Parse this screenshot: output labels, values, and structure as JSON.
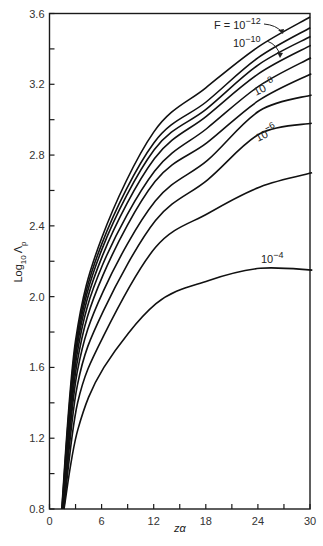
{
  "chart_data": {
    "type": "line",
    "title": "",
    "xlabel": "zα",
    "ylabel": "Log10 Λp",
    "xlim": [
      0,
      30
    ],
    "ylim": [
      0.8,
      3.6
    ],
    "grid": false,
    "legend_position": "inline labels on curves",
    "x_ticks": [
      0,
      6,
      12,
      18,
      24,
      30
    ],
    "x_minor_ticks": [
      3,
      9,
      15,
      21,
      27
    ],
    "y_ticks": [
      0.8,
      1.2,
      1.6,
      2.0,
      2.4,
      2.8,
      3.2,
      3.6
    ],
    "y_minor_ticks": [
      1.0,
      1.4,
      1.8,
      2.2,
      2.6,
      3.0,
      3.4
    ],
    "x": [
      1.4,
      3,
      6,
      12,
      18,
      24,
      30
    ],
    "series": [
      {
        "name": "F = 10^-12",
        "values": [
          0.8,
          1.75,
          2.33,
          2.93,
          3.18,
          3.41,
          3.58
        ]
      },
      {
        "name": "F = 10^-11",
        "values": [
          0.8,
          1.73,
          2.3,
          2.87,
          3.1,
          3.35,
          3.52
        ]
      },
      {
        "name": "F = 10^-10",
        "values": [
          0.8,
          1.71,
          2.27,
          2.83,
          3.06,
          3.31,
          3.47
        ]
      },
      {
        "name": "F = 10^-9",
        "values": [
          0.8,
          1.69,
          2.23,
          2.78,
          3.02,
          3.26,
          3.42
        ]
      },
      {
        "name": "F = 10^-8",
        "values": [
          0.8,
          1.66,
          2.18,
          2.71,
          2.95,
          3.19,
          3.35
        ]
      },
      {
        "name": "F = 10^-7.5",
        "values": [
          0.8,
          1.62,
          2.12,
          2.65,
          2.87,
          3.11,
          3.26
        ]
      },
      {
        "name": "F = 10^-7",
        "values": [
          0.8,
          1.57,
          2.03,
          2.54,
          2.77,
          3.05,
          3.14
        ]
      },
      {
        "name": "F = 10^-6",
        "values": [
          0.8,
          1.5,
          1.92,
          2.43,
          2.66,
          2.92,
          2.98
        ]
      },
      {
        "name": "F = 10^-5",
        "values": [
          0.8,
          1.4,
          1.78,
          2.28,
          2.47,
          2.62,
          2.7
        ]
      },
      {
        "name": "F = 10^-4",
        "values": [
          0.8,
          1.25,
          1.6,
          1.96,
          2.09,
          2.16,
          2.15
        ]
      }
    ],
    "annotations": [
      {
        "text": "F = 10^-12",
        "points_to": "top curve",
        "arrow": true
      },
      {
        "text": "10^-10",
        "points_to": "third curve",
        "arrow": true
      },
      {
        "text": "10^-8",
        "on_curve": "F = 10^-8"
      },
      {
        "text": "10^-6",
        "on_curve": "F = 10^-6"
      },
      {
        "text": "10^-4",
        "on_curve": "F = 10^-4"
      }
    ]
  },
  "labels": {
    "xlabel": "zα",
    "ylabel_main": "Log",
    "ylabel_sub": "10",
    "ylabel_symbol": "Λ",
    "ylabel_symbol_sub": "p",
    "f12_prefix": "F = 10",
    "f12_exp": "−12",
    "f10_base": "10",
    "f10_exp": "−10",
    "f8_base": "10",
    "f8_exp": "−8",
    "f6_base": "10",
    "f6_exp": "−6",
    "f4_base": "10",
    "f4_exp": "−4"
  },
  "tick_labels": {
    "x": [
      "0",
      "6",
      "12",
      "18",
      "24",
      "30"
    ],
    "y": [
      "0.8",
      "1.2",
      "1.6",
      "2.0",
      "2.4",
      "2.8",
      "3.2",
      "3.6"
    ]
  }
}
